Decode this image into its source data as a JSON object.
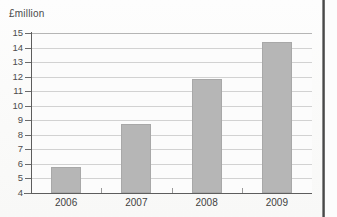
{
  "chart_data": {
    "type": "bar",
    "title": "£million",
    "xlabel": "",
    "ylabel": "£million",
    "categories": [
      "2006",
      "2007",
      "2008",
      "2009"
    ],
    "values": [
      5.8,
      8.75,
      11.85,
      14.35
    ],
    "ylim": [
      4,
      15
    ],
    "ytick_step": 1,
    "yticks": [
      "15",
      "14",
      "13",
      "12",
      "11",
      "10",
      "9",
      "8",
      "7",
      "6",
      "5",
      "4"
    ],
    "grid": true,
    "legend": false,
    "legend_position": "none",
    "series": [
      {
        "name": "£million",
        "values": [
          5.8,
          8.75,
          11.85,
          14.35
        ],
        "color": "#b6b6b6"
      }
    ]
  },
  "colors": {
    "bar_fill": "#b6b6b6",
    "bar_edge": "#a8a8a8",
    "gridline": "#d2d2d2",
    "axis": "#5d5d5d",
    "text": "#3f3f3f",
    "page_edge": "#3f3f3f",
    "background": "#fcfcfc"
  }
}
